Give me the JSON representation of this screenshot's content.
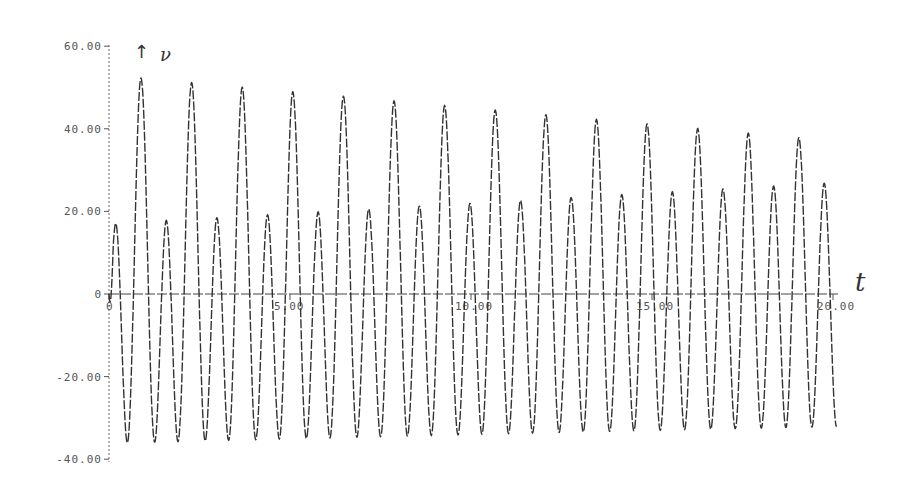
{
  "chart_data": {
    "type": "line",
    "title": "",
    "xlabel": "t",
    "ylabel": "ν",
    "xlim": [
      0,
      20
    ],
    "ylim": [
      -40,
      60
    ],
    "grid": false,
    "legend": null,
    "x_ticks": [
      "0",
      "5.00",
      "10.00",
      "15.00",
      "20.00"
    ],
    "y_ticks": [
      "60.00",
      "40.00",
      "20.00",
      "0",
      "-20.00",
      "-40.00"
    ],
    "line_style": "dashed",
    "series": [
      {
        "name": "ν(t)",
        "description": "Beating oscillation: sum of fundamental (period ≈1.40) and second harmonic; large peaks decay 53→37, small peaks grow 18→27, troughs settle near -31",
        "large_peaks": {
          "t": [
            0.88,
            2.28,
            3.68,
            5.08,
            6.48,
            7.88,
            9.28,
            10.68,
            12.08,
            13.48,
            14.88,
            16.28,
            17.68,
            19.08
          ],
          "v": [
            53,
            52.5,
            51,
            49,
            47.5,
            46,
            44.5,
            43,
            42,
            41,
            40,
            39,
            38,
            37
          ]
        },
        "small_peaks": {
          "t": [
            0.17,
            1.57,
            2.97,
            4.37,
            5.77,
            7.17,
            8.57,
            9.97,
            11.37,
            12.77,
            14.17,
            15.57,
            16.97,
            18.37,
            19.77
          ],
          "v": [
            18,
            16,
            16.5,
            17.5,
            18.5,
            19.5,
            20.5,
            21.5,
            22.5,
            23.5,
            24,
            25,
            25.5,
            26,
            26.5
          ]
        },
        "troughs": {
          "t": [
            0.5,
            1.22,
            1.9,
            2.6,
            3.3,
            4.0,
            4.7,
            5.4,
            6.1,
            6.8,
            7.5,
            8.2,
            8.9,
            9.6,
            10.3,
            11.0,
            11.7,
            12.4,
            13.1,
            13.8,
            14.5,
            15.2,
            15.9,
            16.6,
            17.3,
            18.0,
            18.7,
            19.4
          ],
          "v": [
            -36,
            -29,
            -33,
            -31,
            -32,
            -31,
            -32,
            -31,
            -31.5,
            -31,
            -31.5,
            -31,
            -31.5,
            -31,
            -31.5,
            -31,
            -31.5,
            -31,
            -31.5,
            -31,
            -31.5,
            -31,
            -31.5,
            -31,
            -31.5,
            -31,
            -31.5,
            -31
          ]
        },
        "start": {
          "t": 0,
          "v": 0
        },
        "end": {
          "t": 20.1,
          "v": -28
        },
        "model": {
          "period": 1.398,
          "first_large_peak_t": 0.884,
          "fundamental_amp": [
            18,
            5
          ],
          "harmonic_amp": [
            35,
            32
          ],
          "t_end": 20.1
        }
      }
    ]
  }
}
